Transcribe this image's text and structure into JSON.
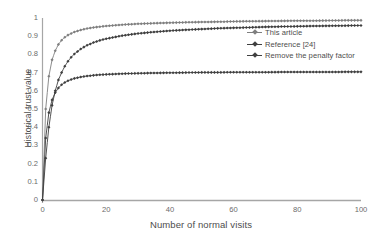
{
  "chart_data": {
    "type": "line",
    "title": "",
    "xlabel": "Number of normal visits",
    "ylabel": "Historical trust value",
    "xlim": [
      0,
      100
    ],
    "ylim": [
      0,
      1
    ],
    "xticks": [
      0,
      20,
      40,
      60,
      80,
      100
    ],
    "yticks": [
      "0",
      "0.1",
      "0.2",
      "0.3",
      "0.4",
      "0.5",
      "0.6",
      "0.7",
      "0.8",
      "0.9",
      "1"
    ],
    "grid": false,
    "legend_position": "upper-right",
    "marker": "diamond",
    "x": [
      0,
      1,
      2,
      3,
      4,
      5,
      6,
      7,
      8,
      9,
      10,
      12,
      14,
      16,
      18,
      20,
      25,
      30,
      35,
      40,
      45,
      50,
      55,
      60,
      65,
      70,
      75,
      80,
      85,
      90,
      95,
      100
    ],
    "series": [
      {
        "name": "This article",
        "color": "#7f7f7f",
        "values": [
          0,
          0.5,
          0.68,
          0.77,
          0.82,
          0.855,
          0.878,
          0.894,
          0.906,
          0.915,
          0.923,
          0.934,
          0.942,
          0.948,
          0.952,
          0.956,
          0.963,
          0.968,
          0.971,
          0.974,
          0.976,
          0.978,
          0.979,
          0.981,
          0.982,
          0.983,
          0.984,
          0.985,
          0.985,
          0.986,
          0.987,
          0.987
        ]
      },
      {
        "name": "Reference [24]",
        "color": "#3f3f3f",
        "values": [
          0,
          0.23,
          0.4,
          0.52,
          0.6,
          0.66,
          0.7,
          0.735,
          0.762,
          0.784,
          0.802,
          0.83,
          0.85,
          0.865,
          0.877,
          0.886,
          0.903,
          0.915,
          0.923,
          0.93,
          0.935,
          0.939,
          0.943,
          0.946,
          0.948,
          0.951,
          0.953,
          0.954,
          0.956,
          0.957,
          0.958,
          0.959
        ]
      },
      {
        "name": "Remove the penalty factor",
        "color": "#404040",
        "values": [
          0,
          0.34,
          0.48,
          0.55,
          0.59,
          0.616,
          0.633,
          0.646,
          0.655,
          0.662,
          0.668,
          0.676,
          0.681,
          0.685,
          0.688,
          0.69,
          0.694,
          0.696,
          0.698,
          0.699,
          0.7,
          0.701,
          0.701,
          0.702,
          0.702,
          0.702,
          0.703,
          0.703,
          0.703,
          0.703,
          0.704,
          0.704
        ]
      }
    ]
  },
  "axis": {
    "line_color": "#a6a6a6"
  }
}
